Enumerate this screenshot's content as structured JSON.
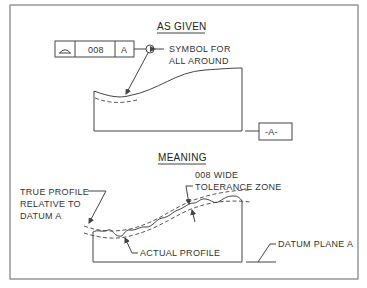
{
  "as_given": {
    "title": "AS GIVEN",
    "feature_control_frame": {
      "symbol": "profile-of-a-surface",
      "tolerance": "008",
      "datum": "A"
    },
    "all_around_label_line1": "SYMBOL FOR",
    "all_around_label_line2": "ALL AROUND",
    "datum_feature": "-A-"
  },
  "meaning": {
    "title": "MEANING",
    "tolerance_zone_line1": "008 WIDE",
    "tolerance_zone_line2": "TOLERANCE ZONE",
    "true_profile_line1": "TRUE PROFILE",
    "true_profile_line2": "RELATIVE TO",
    "true_profile_line3": "DATUM A",
    "actual_profile": "ACTUAL PROFILE",
    "datum_plane": "DATUM PLANE A"
  }
}
